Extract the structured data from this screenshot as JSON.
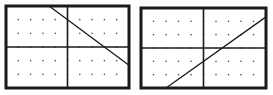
{
  "figure": {
    "colors": {
      "frame": "#1a1a1a",
      "axis": "#1a1a1a",
      "line": "#1a1a1a",
      "dot": "#555555",
      "background": "#ffffff"
    },
    "graphs": [
      {
        "id": "graph-left",
        "frame_px": {
          "x": 6,
          "y": 6,
          "width": 123,
          "height": 82
        },
        "x_range": [
          -5,
          5
        ],
        "y_range": [
          -3,
          3
        ],
        "grid": "dots at integer points",
        "line": {
          "slope": -0.6667,
          "y_intercept": 2,
          "x_intercept": 3,
          "equation": "y = -2/3 x + 2",
          "direction": "decreasing"
        }
      },
      {
        "id": "graph-right",
        "frame_px": {
          "x": 141,
          "y": 8,
          "width": 125,
          "height": 80
        },
        "x_range": [
          -5,
          5
        ],
        "y_range": [
          -3,
          3
        ],
        "grid": "dots at integer points",
        "line": {
          "slope": 0.6667,
          "y_intercept": -1,
          "x_intercept": 1.5,
          "equation": "y = 2/3 x - 1",
          "direction": "increasing"
        }
      }
    ]
  }
}
